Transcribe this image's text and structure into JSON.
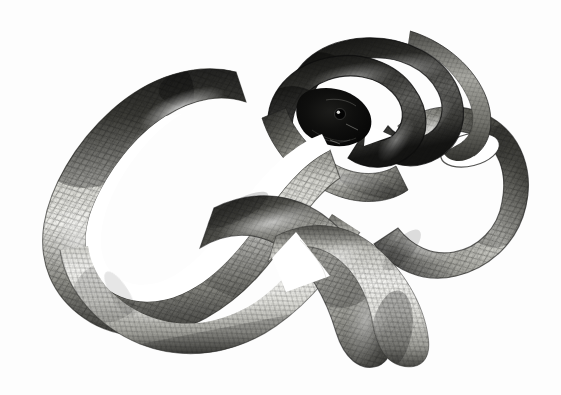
{
  "image": {
    "kind": "natural-image",
    "subject": "snake",
    "description": "Grayscale photographic illustration of a coiled snake viewed from above on a plain white background",
    "title": "Coiled snake on white background",
    "orientation": "landscape",
    "width_px": 561,
    "height_px": 395,
    "background_color": "#fdfdfd",
    "palette": {
      "background": "#fdfdfd",
      "highlight": "#f2f2f0",
      "light_scale": "#d8d8d4",
      "mid_scale": "#9a9a96",
      "mid_dark_scale": "#6b6b68",
      "dark_scale": "#3a3a38",
      "deep_shadow": "#1a1a19",
      "head_black": "#0a0a0a",
      "outline": "#2a2a28"
    },
    "tonal_range": {
      "darkest": "#070707",
      "lightest": "#fdfdfd",
      "dominant_midtone": "#8e8e8a"
    },
    "lighting": {
      "direction": "top-left",
      "specular_highlight": "along dorsal ridge of upper-left body loop",
      "shadow_side": "lower and inner edges of each coil"
    },
    "composition": {
      "subject_bounds": {
        "x": 38,
        "y": 28,
        "width": 492,
        "height": 340
      },
      "negative_space": "white background fills all four corners, heaviest at lower-right and upper-left"
    },
    "anatomy": {
      "head": {
        "label": "head",
        "position": {
          "x": 348,
          "y": 112
        },
        "tone": "near-black, deeply shadowed",
        "features": [
          "eye highlight",
          "jaw line",
          "snout pointing lower-left"
        ]
      },
      "eye": {
        "label": "eye",
        "position": {
          "x": 352,
          "y": 110
        },
        "tone": "black with small white catchlight"
      },
      "tail": {
        "label": "tail tip",
        "position": {
          "x": 412,
          "y": 32
        },
        "tone": "mid gray, tapering to a fine point curving up and right"
      },
      "body_segments": [
        {
          "name": "upper-left dorsal loop",
          "tone": "dark top grading to bright highlight"
        },
        {
          "name": "left outer bend",
          "tone": "dark gray, heavy scale shading"
        },
        {
          "name": "lower-left S curve",
          "tone": "light, strongly lit belly-side scales"
        },
        {
          "name": "central crossing coil",
          "tone": "mid gray with cast shadow"
        },
        {
          "name": "right vertical coil with open loop",
          "tone": "dark rim, bright interior scales"
        },
        {
          "name": "head-and-neck coil cluster",
          "tone": "darkest region of the image"
        },
        {
          "name": "lower-right terminal curve",
          "tone": "light gray to mid gray"
        }
      ],
      "open_loops": [
        {
          "name": "large left loop void",
          "center": {
            "x": 148,
            "y": 200
          },
          "shape": "elongated teardrop",
          "fill": "#ffffff"
        },
        {
          "name": "right coil eye void",
          "center": {
            "x": 470,
            "y": 148
          },
          "shape": "ellipse",
          "fill": "#ffffff"
        },
        {
          "name": "central triangular gap",
          "center": {
            "x": 300,
            "y": 255
          },
          "shape": "triangular wedge",
          "fill": "#ffffff"
        },
        {
          "name": "small gap below head",
          "center": {
            "x": 382,
            "y": 128
          },
          "shape": "small triangle",
          "fill": "#ffffff"
        }
      ]
    },
    "texture": {
      "pattern": "overlapping rhomboid keeled scales",
      "arrangement": "diagonal rows running obliquely across the body axis",
      "approx_scale_size_px": 7,
      "rendering": "fine engraving-like stippling and cross hatching"
    },
    "alt_text": "A large snake coiled into overlapping loops, photographed in black and white against a plain white background. Its dark head rests near the center of the coils and the slender tail arcs above to the upper right."
  }
}
